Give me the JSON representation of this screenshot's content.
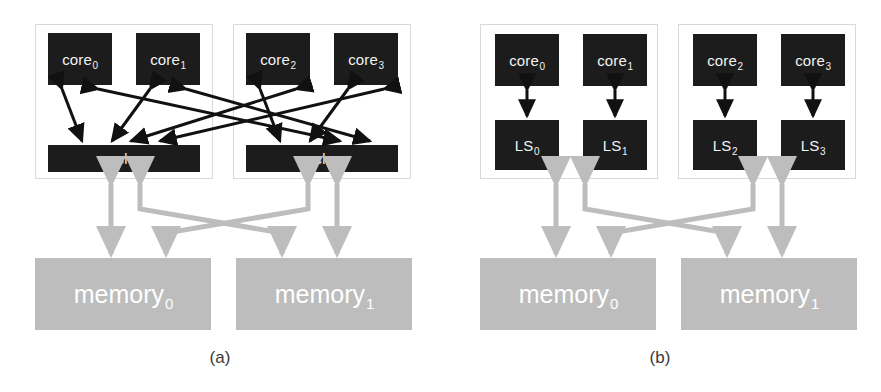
{
  "figure": {
    "type": "diagram",
    "background": "#ffffff",
    "colors": {
      "unit_fill": "#1c1c1c",
      "unit_text": "#f2f2f2",
      "memory_fill": "#bdbdbd",
      "memory_text": "#ffffff",
      "frame_border": "#d9d9d9",
      "black_arrow": "#111111",
      "gray_arrow": "#bdbdbd",
      "caption_text": "#3a3a3a"
    }
  },
  "panels": [
    {
      "id": "a",
      "caption": "(a)",
      "groups": [
        {
          "id": "a-group-0",
          "cores": [
            {
              "name": "core",
              "index": "0"
            },
            {
              "name": "core",
              "index": "1"
            }
          ],
          "cache": {
            "name": "cache",
            "index": "0"
          }
        },
        {
          "id": "a-group-1",
          "cores": [
            {
              "name": "core",
              "index": "2"
            },
            {
              "name": "core",
              "index": "3"
            }
          ],
          "cache": {
            "name": "cache",
            "index": "1"
          }
        }
      ],
      "memories": [
        {
          "name": "memory",
          "index": "0"
        },
        {
          "name": "memory",
          "index": "1"
        }
      ]
    },
    {
      "id": "b",
      "caption": "(b)",
      "groups": [
        {
          "id": "b-group-0",
          "cores": [
            {
              "name": "core",
              "index": "0"
            },
            {
              "name": "core",
              "index": "1"
            }
          ],
          "stores": [
            {
              "name": "LS",
              "index": "0"
            },
            {
              "name": "LS",
              "index": "1"
            }
          ]
        },
        {
          "id": "b-group-1",
          "cores": [
            {
              "name": "core",
              "index": "2"
            },
            {
              "name": "core",
              "index": "3"
            }
          ],
          "stores": [
            {
              "name": "LS",
              "index": "2"
            },
            {
              "name": "LS",
              "index": "3"
            }
          ]
        }
      ],
      "memories": [
        {
          "name": "memory",
          "index": "0"
        },
        {
          "name": "memory",
          "index": "1"
        }
      ]
    }
  ],
  "labels": {
    "a": {
      "core0": "core",
      "core0_sub": "0",
      "core1": "core",
      "core1_sub": "1",
      "core2": "core",
      "core2_sub": "2",
      "core3": "core",
      "core3_sub": "3",
      "cache0": "cache",
      "cache0_sub": "0",
      "cache1": "cache",
      "cache1_sub": "1",
      "memory0": "memory",
      "memory0_sub": "0",
      "memory1": "memory",
      "memory1_sub": "1",
      "caption": "(a)"
    },
    "b": {
      "core0": "core",
      "core0_sub": "0",
      "core1": "core",
      "core1_sub": "1",
      "core2": "core",
      "core2_sub": "2",
      "core3": "core",
      "core3_sub": "3",
      "ls0": "LS",
      "ls0_sub": "0",
      "ls1": "LS",
      "ls1_sub": "1",
      "ls2": "LS",
      "ls2_sub": "2",
      "ls3": "LS",
      "ls3_sub": "3",
      "memory0": "memory",
      "memory0_sub": "0",
      "memory1": "memory",
      "memory1_sub": "1",
      "caption": "(b)"
    }
  }
}
